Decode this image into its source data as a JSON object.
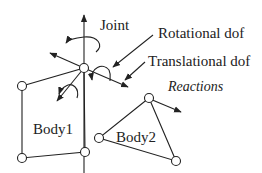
{
  "diagram": {
    "labels": {
      "joint": "Joint",
      "rotational_dof": "Rotational dof",
      "translational_dof": "Translational dof",
      "reactions": "Reactions",
      "body1": "Body1",
      "body2": "Body2"
    },
    "colors": {
      "stroke": "#222222",
      "background": "#ffffff"
    }
  }
}
